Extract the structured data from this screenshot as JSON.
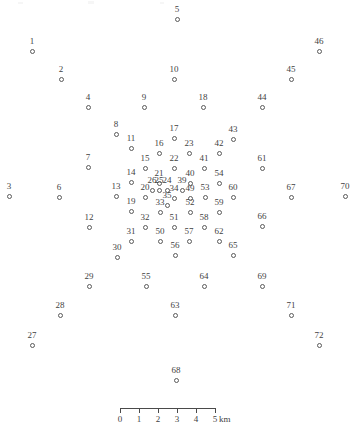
{
  "figure": {
    "type": "point-map",
    "marker_color": "#5a5a5a",
    "label_color": "#3f3f3f",
    "background": "#ffffff",
    "width": 364,
    "height": 431
  },
  "chart_data": {
    "type": "scatter",
    "title": "",
    "xlabel": "",
    "ylabel": "",
    "grid": false,
    "legend": null,
    "axis_units": "km",
    "scale_px_per_km": 19,
    "points": [
      {
        "label": "1",
        "x": 32,
        "y": 51
      },
      {
        "label": "2",
        "x": 61,
        "y": 79
      },
      {
        "label": "3",
        "x": 9,
        "y": 196
      },
      {
        "label": "4",
        "x": 88,
        "y": 107
      },
      {
        "label": "5",
        "x": 177,
        "y": 19
      },
      {
        "label": "6",
        "x": 59,
        "y": 197
      },
      {
        "label": "7",
        "x": 88,
        "y": 167
      },
      {
        "label": "8",
        "x": 116,
        "y": 134
      },
      {
        "label": "9",
        "x": 144,
        "y": 107
      },
      {
        "label": "10",
        "x": 174,
        "y": 79
      },
      {
        "label": "11",
        "x": 131,
        "y": 148
      },
      {
        "label": "12",
        "x": 89,
        "y": 227
      },
      {
        "label": "13",
        "x": 116,
        "y": 196
      },
      {
        "label": "14",
        "x": 131,
        "y": 182
      },
      {
        "label": "15",
        "x": 145,
        "y": 168
      },
      {
        "label": "16",
        "x": 159,
        "y": 153
      },
      {
        "label": "17",
        "x": 174,
        "y": 138
      },
      {
        "label": "18",
        "x": 203,
        "y": 107
      },
      {
        "label": "19",
        "x": 131,
        "y": 211
      },
      {
        "label": "20",
        "x": 145,
        "y": 197
      },
      {
        "label": "21",
        "x": 159,
        "y": 183
      },
      {
        "label": "22",
        "x": 174,
        "y": 168
      },
      {
        "label": "23",
        "x": 189,
        "y": 153
      },
      {
        "label": "24",
        "x": 167,
        "y": 190
      },
      {
        "label": "25",
        "x": 159,
        "y": 190
      },
      {
        "label": "26",
        "x": 152,
        "y": 190
      },
      {
        "label": "27",
        "x": 32,
        "y": 345
      },
      {
        "label": "28",
        "x": 60,
        "y": 315
      },
      {
        "label": "29",
        "x": 89,
        "y": 286
      },
      {
        "label": "30",
        "x": 117,
        "y": 257
      },
      {
        "label": "31",
        "x": 131,
        "y": 241
      },
      {
        "label": "32",
        "x": 145,
        "y": 227
      },
      {
        "label": "33",
        "x": 160,
        "y": 212
      },
      {
        "label": "34",
        "x": 174,
        "y": 198
      },
      {
        "label": "35",
        "x": 167,
        "y": 205
      },
      {
        "label": "39",
        "x": 182,
        "y": 190
      },
      {
        "label": "40",
        "x": 190,
        "y": 183
      },
      {
        "label": "41",
        "x": 204,
        "y": 168
      },
      {
        "label": "42",
        "x": 219,
        "y": 153
      },
      {
        "label": "43",
        "x": 233,
        "y": 139
      },
      {
        "label": "44",
        "x": 262,
        "y": 107
      },
      {
        "label": "45",
        "x": 291,
        "y": 79
      },
      {
        "label": "46",
        "x": 319,
        "y": 51
      },
      {
        "label": "49",
        "x": 190,
        "y": 198
      },
      {
        "label": "50",
        "x": 160,
        "y": 241
      },
      {
        "label": "51",
        "x": 174,
        "y": 227
      },
      {
        "label": "52",
        "x": 190,
        "y": 212
      },
      {
        "label": "53",
        "x": 205,
        "y": 197
      },
      {
        "label": "54",
        "x": 219,
        "y": 183
      },
      {
        "label": "55",
        "x": 146,
        "y": 286
      },
      {
        "label": "56",
        "x": 175,
        "y": 255
      },
      {
        "label": "57",
        "x": 189,
        "y": 241
      },
      {
        "label": "58",
        "x": 204,
        "y": 227
      },
      {
        "label": "59",
        "x": 219,
        "y": 212
      },
      {
        "label": "60",
        "x": 233,
        "y": 197
      },
      {
        "label": "61",
        "x": 262,
        "y": 168
      },
      {
        "label": "62",
        "x": 219,
        "y": 241
      },
      {
        "label": "63",
        "x": 175,
        "y": 315
      },
      {
        "label": "64",
        "x": 204,
        "y": 286
      },
      {
        "label": "65",
        "x": 233,
        "y": 255
      },
      {
        "label": "66",
        "x": 262,
        "y": 226
      },
      {
        "label": "67",
        "x": 291,
        "y": 197
      },
      {
        "label": "68",
        "x": 176,
        "y": 380
      },
      {
        "label": "69",
        "x": 262,
        "y": 286
      },
      {
        "label": "70",
        "x": 345,
        "y": 196
      },
      {
        "label": "71",
        "x": 291,
        "y": 315
      },
      {
        "label": "72",
        "x": 319,
        "y": 345
      }
    ]
  },
  "scalebar": {
    "name": "distance-scale",
    "ticks": [
      "0",
      "1",
      "2",
      "3",
      "4",
      "5"
    ],
    "unit": "km",
    "start_px": 120,
    "spacing_px": 19
  }
}
